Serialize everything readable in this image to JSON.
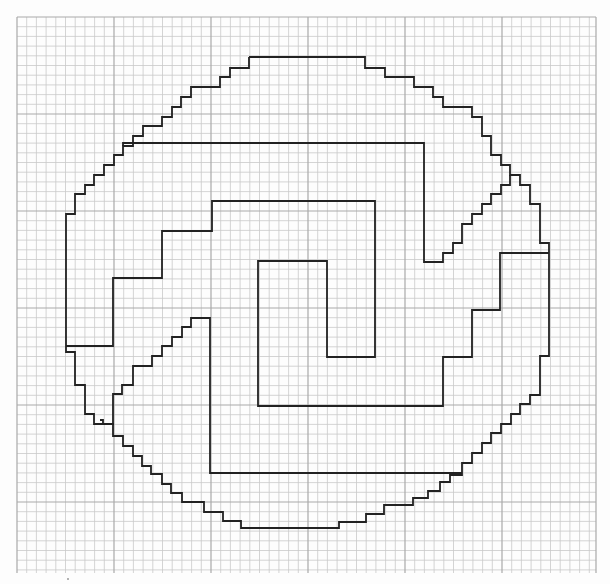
{
  "page": {
    "background": "#fdfdfd",
    "minor_grid_color": "#c9c9c9",
    "major_grid_color": "#a9a9a9",
    "ink_color": "#222222"
  },
  "grid": {
    "x0": 17,
    "y0": 17,
    "x1": 596,
    "y1": 573,
    "cell": 9.7,
    "major_every": 10
  },
  "drawing": {
    "description": "Stepped circle outline with inner rectilinear spiral hand-drawn on graph paper",
    "paths": [
      {
        "name": "outer-circle-top-right",
        "points": "249,57 365,57 365,68 385,68 385,77 414,77 414,87 433,87 433,97 443,97 443,107 472,107 472,117 482,117 482,136 491,136 491,155 501,155 501,165 510,165 510,175 520,175 520,185 530,185 530,204 540,204 540,243 549,243 549,253"
      },
      {
        "name": "outer-circle-top-left",
        "points": "249,57 249,68 230,68 230,77 220,77 220,87 191,87 191,97 181,97 181,107 172,107 172,117 162,117 162,126 143,126 143,136 133,136 133,146 123,146 123,155 114,155 114,165 104,165 104,175 94,175 94,185 85,185 85,194 75,194 75,214 66,214 66,346"
      },
      {
        "name": "inner-top-bar",
        "points": "123,146 123,143 424,143 424,262 443,262 443,253 453,253 453,243 462,243 462,224 472,224 472,214 482,214 482,204 491,204 491,194 501,194 501,185 510,185 510,175"
      },
      {
        "name": "right-wing",
        "points": "549,253 549,356 540,356 540,395 530,395 530,404 520,404 520,414 511,414 511,424 501,424 501,433 491,433 491,443 482,443 482,453 472,453 472,463 462,463 462,475 450,475 450,482 440,482 440,491 428,491 428,498 413,498 413,505 384,505 384,514 366,514 366,522 339,522 339,528 241,528 241,521 223,521 223,512 204,512 204,502 182,502 182,493 171,493 171,484 162,484 162,474 151,474 151,466 142,466 142,456 133,456 133,446 123,446 123,436 113,436 113,424 103,424 103,420 100,420"
      },
      {
        "name": "left-lower-hook",
        "points": "66,346 66,352 75,352 75,385 85,385 85,414 94,414 94,424 103,424"
      },
      {
        "name": "left-inner-step",
        "points": "66,346 113,346 113,278 162,278 162,231 212,231 212,201 375,201 375,357 327,357 327,261 258,261 258,406 443,406 443,357 472,357 472,310 500,310 500,253 549,253"
      },
      {
        "name": "center-left-staircase",
        "points": "103,424 113,424 113,394 122,394 122,385 133,385 133,366 152,366 152,356 162,356 162,346 172,346 172,337 182,337 182,327 191,327 191,318 210,318 210,473 462,473"
      }
    ]
  }
}
